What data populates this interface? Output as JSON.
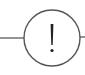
{
  "diagram": {
    "type": "intermediate-event",
    "symbol": "!",
    "icon": "exclamation-icon",
    "colors": {
      "stroke": "#555555",
      "symbol": "#222222",
      "background": "#ffffff"
    },
    "incoming_edge": {
      "from_x": 0,
      "to_x": 24,
      "y": 38
    },
    "outgoing_edge": {
      "from_x": 81,
      "to_x": 85,
      "y": 37
    },
    "node": {
      "cx": 52,
      "cy": 38,
      "r": 28
    }
  }
}
